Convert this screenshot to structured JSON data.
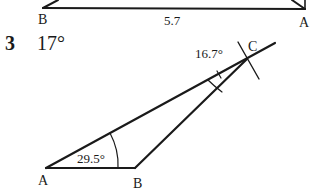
{
  "top_figure": {
    "vertices": {
      "left": "B",
      "right": "A"
    },
    "side_length": "5.7"
  },
  "question": {
    "number": "3",
    "answer": "17°"
  },
  "bottom_figure": {
    "vertices": {
      "a": "A",
      "b": "B",
      "c": "C"
    },
    "angles": {
      "at_a": "29.5°",
      "at_c": "16.7°"
    }
  },
  "colors": {
    "ink": "#1a1a1a",
    "background": "#ffffff"
  }
}
